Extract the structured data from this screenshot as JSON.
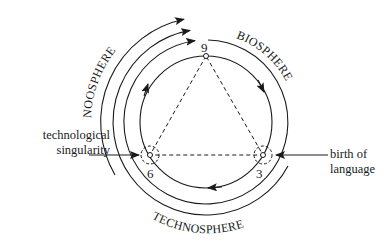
{
  "diagram": {
    "spheres": {
      "noosphere": "NOOSPHERE",
      "biosphere": "BIOSPHERE",
      "technosphere": "TECHNOSPHERE"
    },
    "points": {
      "top": "9",
      "left": "6",
      "right": "3"
    },
    "annotations": {
      "left_line1": "technological",
      "left_line2": "singularity",
      "right_line1": "birth of",
      "right_line2": "language"
    },
    "colors": {
      "stroke": "#1a1a1a",
      "background": "#ffffff"
    }
  }
}
